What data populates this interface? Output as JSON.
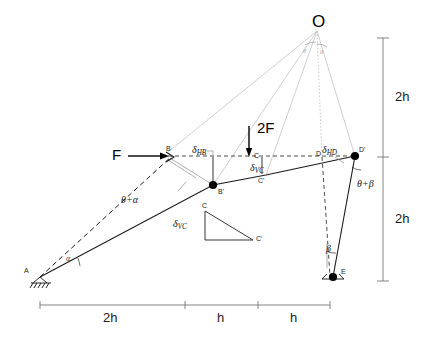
{
  "figure": {
    "background": "#ffffff",
    "ink": "#111111",
    "faint": "#c3c3c3"
  },
  "nodes": {
    "A": "A",
    "B": "B",
    "B_prime": "B'",
    "C": "C",
    "C_prime": "C'",
    "D": "D",
    "D_prime": "D'",
    "E": "E",
    "O": "O"
  },
  "forces": {
    "horizontal": "F",
    "vertical": "2F"
  },
  "displacements": {
    "hb_symbol": "δ",
    "hb_sub": "HB",
    "vc_symbol": "δ",
    "vc_sub": "VC",
    "hd_symbol": "δ",
    "hd_sub": "HD",
    "inset_symbol": "δ",
    "inset_sub": "VC"
  },
  "angles": {
    "alpha": "α",
    "beta": "β",
    "theta_at_O_left": "θ",
    "theta_at_O_right": "θ",
    "theta_plus_alpha": "θ+α",
    "theta_plus_beta": "θ+β",
    "beta_at_E": "β"
  },
  "dimensions": {
    "bottom": [
      {
        "label": "2h"
      },
      {
        "label": "h"
      },
      {
        "label": "h"
      }
    ],
    "right": [
      {
        "label": "2h"
      },
      {
        "label": "2h"
      }
    ]
  },
  "inset": {
    "top_vertex": "C",
    "right_vertex": "C'",
    "leg_label_symbol": "δ",
    "leg_label_sub": "VC"
  }
}
